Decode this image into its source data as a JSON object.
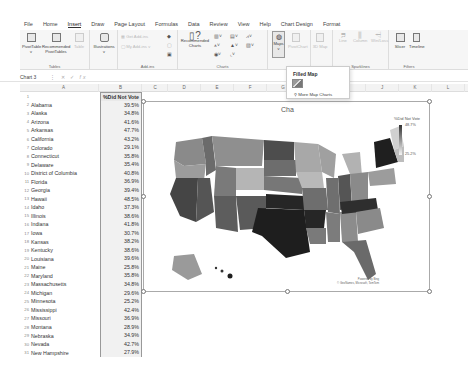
{
  "menubar": {
    "items": [
      "File",
      "Home",
      "Insert",
      "Draw",
      "Page Layout",
      "Formulas",
      "Data",
      "Review",
      "View",
      "Help",
      "Chart Design",
      "Format"
    ],
    "active": "Insert"
  },
  "ribbon": {
    "tables": {
      "label": "Tables",
      "buttons": [
        "PivotTable",
        "Recommended PivotTables",
        "Table"
      ]
    },
    "illustrations": {
      "label": "Illustrations"
    },
    "addins": {
      "label": "Add-ins",
      "buttons": [
        "Get Add-ins",
        "My Add-ins"
      ]
    },
    "charts": {
      "label": "Charts",
      "buttons": [
        "Recommended Charts"
      ]
    },
    "maps": {
      "label": "Maps"
    },
    "pivotchart": {
      "label": "PivotChart"
    },
    "map3d": {
      "label": "3D Map"
    },
    "sparklines": {
      "label": "Sparklines",
      "buttons": [
        "Line",
        "Column",
        "Win/Loss"
      ]
    },
    "filters": {
      "label": "Filters",
      "buttons": [
        "Slicer",
        "Timeline"
      ]
    }
  },
  "formulabar": {
    "namebox": "Chart 3",
    "fx": "fx"
  },
  "columns": [
    "A",
    "B",
    "C",
    "D",
    "E",
    "F",
    "G",
    "H",
    "I",
    "J",
    "K",
    "L"
  ],
  "sheet": {
    "header_b": "%Did Not Vote",
    "rows": [
      {
        "n": "2",
        "state": "Alabama",
        "value": "39.5%"
      },
      {
        "n": "3",
        "state": "Alaska",
        "value": "34.8%"
      },
      {
        "n": "4",
        "state": "Arizona",
        "value": "41.6%"
      },
      {
        "n": "5",
        "state": "Arkansas",
        "value": "47.7%"
      },
      {
        "n": "6",
        "state": "California",
        "value": "43.2%"
      },
      {
        "n": "7",
        "state": "Colorado",
        "value": "29.1%"
      },
      {
        "n": "8",
        "state": "Connecticut",
        "value": "35.8%"
      },
      {
        "n": "9",
        "state": "Delaware",
        "value": "35.4%"
      },
      {
        "n": "10",
        "state": "District of Columbia",
        "value": "40.8%"
      },
      {
        "n": "11",
        "state": "Florida",
        "value": "36.9%"
      },
      {
        "n": "12",
        "state": "Georgia",
        "value": "39.4%"
      },
      {
        "n": "13",
        "state": "Hawaii",
        "value": "48.5%"
      },
      {
        "n": "14",
        "state": "Idaho",
        "value": "37.3%"
      },
      {
        "n": "15",
        "state": "Illinois",
        "value": "38.6%"
      },
      {
        "n": "16",
        "state": "Indiana",
        "value": "41.8%"
      },
      {
        "n": "17",
        "state": "Iowa",
        "value": "30.7%"
      },
      {
        "n": "18",
        "state": "Kansas",
        "value": "38.2%"
      },
      {
        "n": "19",
        "state": "Kentucky",
        "value": "38.6%"
      },
      {
        "n": "20",
        "state": "Louisiana",
        "value": "39.6%"
      },
      {
        "n": "21",
        "state": "Maine",
        "value": "25.8%"
      },
      {
        "n": "22",
        "state": "Maryland",
        "value": "35.8%"
      },
      {
        "n": "23",
        "state": "Massachusetts",
        "value": "34.8%"
      },
      {
        "n": "24",
        "state": "Michigan",
        "value": "29.6%"
      },
      {
        "n": "25",
        "state": "Minnesota",
        "value": "25.2%"
      },
      {
        "n": "26",
        "state": "Mississippi",
        "value": "42.4%"
      },
      {
        "n": "27",
        "state": "Missouri",
        "value": "36.9%"
      },
      {
        "n": "28",
        "state": "Montana",
        "value": "28.9%"
      },
      {
        "n": "29",
        "state": "Nebraska",
        "value": "34.9%"
      },
      {
        "n": "30",
        "state": "Nevada",
        "value": "42.7%"
      },
      {
        "n": "31",
        "state": "New Hampshire",
        "value": "27.9%"
      }
    ]
  },
  "chart": {
    "title": "Cha",
    "legend_title": "%Did Not Vote",
    "legend_max": "48.7%",
    "legend_min": "25.2%",
    "attribution_1": "Powered by Bing",
    "attribution_2": "© GeoNames, Microsoft, TomTom"
  },
  "dropdown": {
    "title": "Filled Map",
    "more": "More Map Charts"
  }
}
